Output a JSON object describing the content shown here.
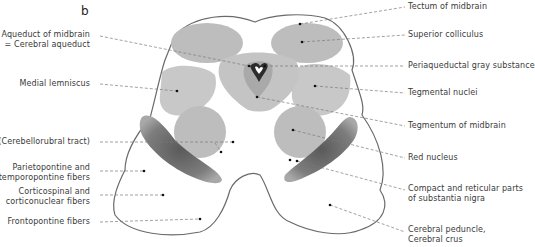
{
  "figure": {
    "panel_letter": "b",
    "colors": {
      "background": "#ffffff",
      "outline": "#6a6a6a",
      "nucleus_gray": "#bdbdbd",
      "light_gray": "#d9d9d9",
      "substantia_nigra": "#6f6f6f",
      "leader_line": "#7a7a7a",
      "label_text": "#3a3a3a"
    }
  },
  "labels_left": [
    {
      "id": "aqueduct",
      "text": "Aqueduct of midbrain\n= Cerebral aqueduct"
    },
    {
      "id": "medial-lemniscus",
      "text": "Medial lemniscus"
    },
    {
      "id": "cerebellorubral",
      "text": "(Cerebellorubral tract)"
    },
    {
      "id": "parietopontine",
      "text": "Parietopontine and\ntemporopontine fibers"
    },
    {
      "id": "corticospinal",
      "text": "Corticospinal and\ncorticonuclear fibers"
    },
    {
      "id": "frontopontine",
      "text": "Frontopontine fibers"
    }
  ],
  "labels_right": [
    {
      "id": "tectum",
      "text": "Tectum of midbrain"
    },
    {
      "id": "superior-colliculus",
      "text": "Superior colliculus"
    },
    {
      "id": "periaqueductal",
      "text": "Periaqueductal gray substance"
    },
    {
      "id": "tegmental-nuclei",
      "text": "Tegmental nuclei"
    },
    {
      "id": "tegmentum",
      "text": "Tegmentum of midbrain"
    },
    {
      "id": "red-nucleus",
      "text": "Red nucleus"
    },
    {
      "id": "substantia-nigra",
      "text": "Compact and reticular parts\nof substantia nigra"
    },
    {
      "id": "cerebral-peduncle",
      "text": "Cerebral peduncle,\nCerebral crus"
    }
  ]
}
